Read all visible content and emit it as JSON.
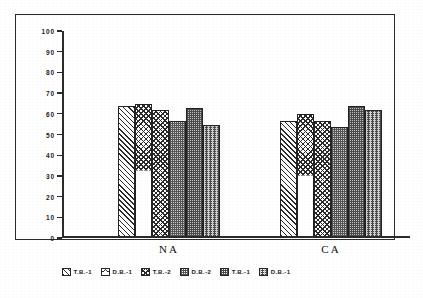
{
  "chart_data": {
    "type": "bar",
    "title": "",
    "subtitle": "",
    "xlabel": "",
    "ylabel": "",
    "categories": [
      "NA",
      "CA"
    ],
    "ylim": [
      0,
      100
    ],
    "yticks": [
      0,
      10,
      20,
      30,
      40,
      50,
      60,
      70,
      80,
      90,
      100
    ],
    "ytick_labels": [
      "0",
      "10",
      "20",
      "30",
      "40",
      "50",
      "60",
      "70",
      "80",
      "90",
      "100"
    ],
    "grid": false,
    "legend_position": "bottom",
    "series": [
      {
        "name": "T.B.-1",
        "pattern": "diagonal-hatch",
        "values": [
          63,
          56
        ]
      },
      {
        "name": "D.B.-1",
        "pattern": "chevron-herringbone",
        "values": [
          64,
          59
        ]
      },
      {
        "name": "T.B.-2",
        "pattern": "cross-hatch",
        "values": [
          61,
          56
        ]
      },
      {
        "name": "D.B.-2",
        "pattern": "dense-stipple",
        "values": [
          56,
          53
        ]
      },
      {
        "name": "T.B.-1",
        "pattern": "medium-stipple",
        "values": [
          62,
          63
        ]
      },
      {
        "name": "D.B.-1",
        "pattern": "streaked-stipple",
        "values": [
          54,
          61
        ]
      }
    ],
    "annotations": []
  },
  "axis": {
    "tick_labels": [
      "100",
      "90",
      "80",
      "70",
      "60",
      "50",
      "40",
      "30",
      "20",
      "10",
      "0"
    ],
    "category_labels": [
      "NA",
      "CA"
    ]
  },
  "legend": {
    "entries": [
      {
        "label": "T.B.-1"
      },
      {
        "label": "D.B.-1"
      },
      {
        "label": "T.B.-2"
      },
      {
        "label": "D.B.-2"
      },
      {
        "label": "T.B.-1"
      },
      {
        "label": "D.B.-1"
      }
    ]
  },
  "colors": {
    "ink": "#2b2b2b",
    "paper": "#ffffff",
    "hatch": "#2a2a2a"
  }
}
